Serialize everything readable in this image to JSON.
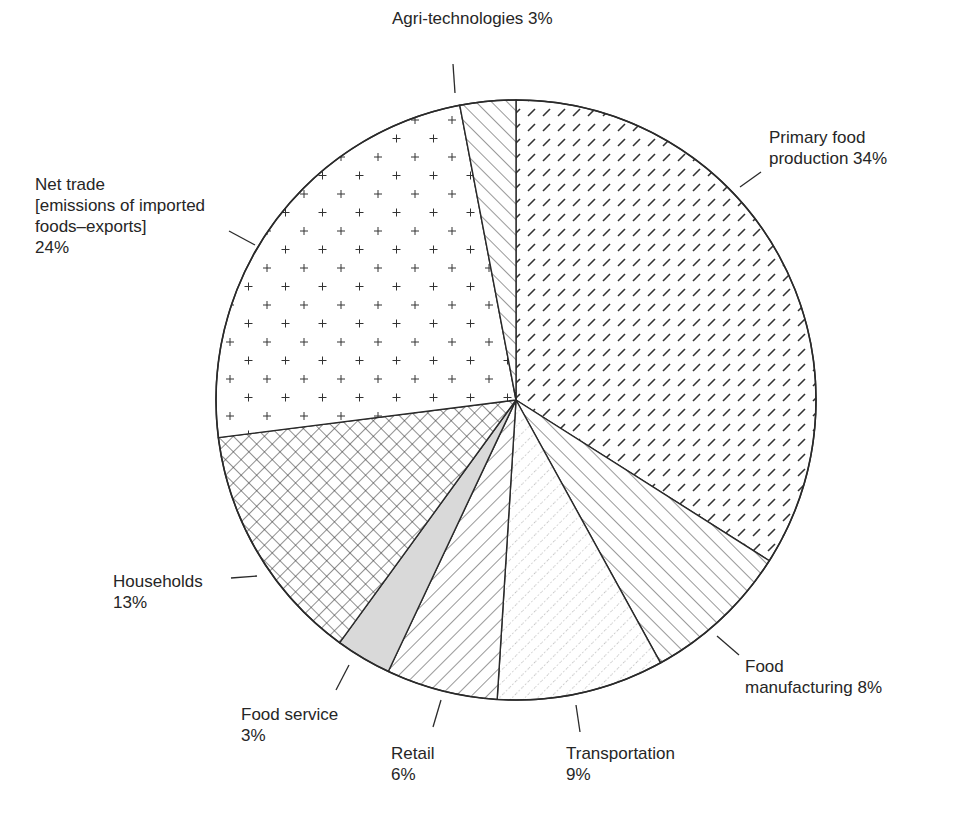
{
  "chart_data": {
    "type": "pie",
    "title": "",
    "start_angle_deg": 0,
    "direction": "clockwise",
    "unit": "%",
    "slices": [
      {
        "label": "Primary food production",
        "value": 34,
        "pattern": "dashes",
        "label_text": "Primary food\nproduction 34%"
      },
      {
        "label": "Food manufacturing",
        "value": 8,
        "pattern": "diagonal-forward",
        "label_text": "Food\nmanufacturing 8%"
      },
      {
        "label": "Transportation",
        "value": 9,
        "pattern": "dotted-diagonal",
        "label_text": "Transportation\n9%"
      },
      {
        "label": "Retail",
        "value": 6,
        "pattern": "diagonal-back",
        "label_text": "Retail\n6%"
      },
      {
        "label": "Food service",
        "value": 3,
        "pattern": "grey-fill",
        "label_text": "Food service\n3%"
      },
      {
        "label": "Households",
        "value": 13,
        "pattern": "crosshatch",
        "label_text": "Households\n13%"
      },
      {
        "label": "Net trade [emissions of imported foods–exports]",
        "value": 24,
        "pattern": "plus",
        "label_text": "Net trade\n[emissions of imported\nfoods–exports]\n24%"
      },
      {
        "label": "Agri-technologies",
        "value": 3,
        "pattern": "diagonal-forward",
        "label_text": "Agri-technologies 3%"
      }
    ],
    "legend": "none (direct labels with leader lines)"
  },
  "colors": {
    "stroke": "#2a2a2a",
    "pattern_ink": "#333333",
    "grey_fill": "#d9d9d9",
    "background": "#ffffff"
  }
}
